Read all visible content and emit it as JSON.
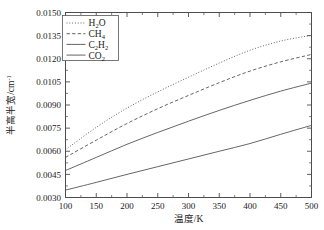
{
  "chart_data": {
    "type": "line",
    "title": "",
    "xlabel": "温度/K",
    "ylabel": "半高半宽/cm⁻¹",
    "xlim": [
      100,
      500
    ],
    "ylim": [
      0.003,
      0.015
    ],
    "grid": false,
    "legend_position": "top-left",
    "xticks": [
      100,
      150,
      200,
      250,
      300,
      350,
      400,
      450,
      500
    ],
    "xtick_labels": [
      "100",
      "150",
      "200",
      "250",
      "300",
      "350",
      "400",
      "450",
      "500"
    ],
    "yticks": [
      0.003,
      0.0045,
      0.006,
      0.0075,
      0.009,
      0.0105,
      0.012,
      0.0135,
      0.015
    ],
    "ytick_labels": [
      "0.0030",
      "0.0045",
      "0.0060",
      "0.0075",
      "0.0090",
      "0.0105",
      "0.0120",
      "0.0135",
      "0.0150"
    ],
    "x": [
      100,
      150,
      200,
      250,
      300,
      350,
      400,
      450,
      500
    ],
    "series": [
      {
        "name": "H2O",
        "label_main": "H",
        "label_sub1": "2",
        "label_mid": "O",
        "style": "dotted",
        "color": "#555555",
        "values": [
          0.0061,
          0.00755,
          0.0088,
          0.00985,
          0.0108,
          0.01172,
          0.01255,
          0.01315,
          0.01352
        ]
      },
      {
        "name": "CH4",
        "label_main": "CH",
        "label_sub1": "4",
        "label_mid": "",
        "style": "dashed",
        "color": "#555555",
        "values": [
          0.0056,
          0.00672,
          0.0078,
          0.00876,
          0.00962,
          0.01045,
          0.0112,
          0.0118,
          0.01228
        ]
      },
      {
        "name": "C2H2",
        "label_main": "C",
        "label_sub1": "2",
        "label_mid": "H",
        "label_sub2": "2",
        "style": "solid",
        "color": "#555555",
        "values": [
          0.00475,
          0.0056,
          0.00645,
          0.00722,
          0.00795,
          0.00865,
          0.0093,
          0.0099,
          0.01042
        ]
      },
      {
        "name": "CO2",
        "label_main": "CO",
        "label_sub1": "2",
        "label_mid": "",
        "style": "solid",
        "color": "#555555",
        "values": [
          0.00348,
          0.00398,
          0.0045,
          0.005,
          0.0055,
          0.006,
          0.0065,
          0.0071,
          0.00768
        ]
      }
    ]
  },
  "legend": {
    "entries": [
      "H₂O",
      "CH₄",
      "C₂H₂",
      "CO₂"
    ]
  },
  "axes": {
    "x_title": "温度/K",
    "y_title_main": "半高半宽/cm",
    "y_title_exp": "-1"
  }
}
